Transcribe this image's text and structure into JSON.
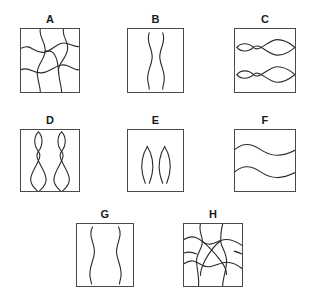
{
  "figure": {
    "background_color": "#ffffff",
    "stroke_color": "#2b2b2b",
    "box_border_color": "#4a4a4a",
    "label_color": "#1a1a1a",
    "width": 314,
    "height": 299
  },
  "panels": [
    {
      "label": "A",
      "id": "panel-a",
      "description": "curved mesh grid of wavy lines",
      "pattern": "mesh",
      "box": {
        "x": 20,
        "y": 28,
        "w": 60,
        "h": 65
      },
      "label_pos": {
        "x": 20,
        "y": 13,
        "w": 60
      }
    },
    {
      "label": "B",
      "id": "panel-b",
      "description": "two vertical wavy lines close together",
      "pattern": "vertical-waves",
      "box": {
        "x": 127,
        "y": 28,
        "w": 57,
        "h": 65
      },
      "label_pos": {
        "x": 127,
        "y": 13,
        "w": 57
      }
    },
    {
      "label": "C",
      "id": "panel-c",
      "description": "two rows of horizontal crossing sinusoids forming lens shapes",
      "pattern": "horizontal-lenses",
      "box": {
        "x": 234,
        "y": 28,
        "w": 62,
        "h": 65
      },
      "label_pos": {
        "x": 234,
        "y": 13,
        "w": 62
      }
    },
    {
      "label": "D",
      "id": "panel-d",
      "description": "two columns of vertical crossing sinusoids forming stacked lens shapes",
      "pattern": "vertical-lenses",
      "box": {
        "x": 20,
        "y": 129,
        "w": 60,
        "h": 63
      },
      "label_pos": {
        "x": 20,
        "y": 114,
        "w": 60
      }
    },
    {
      "label": "E",
      "id": "panel-e",
      "description": "two small pointed leaf shapes",
      "pattern": "leaves",
      "box": {
        "x": 127,
        "y": 129,
        "w": 57,
        "h": 63
      },
      "label_pos": {
        "x": 127,
        "y": 114,
        "w": 57
      }
    },
    {
      "label": "F",
      "id": "panel-f",
      "description": "two horizontal wavy lines",
      "pattern": "horizontal-waves",
      "box": {
        "x": 234,
        "y": 129,
        "w": 62,
        "h": 63
      },
      "label_pos": {
        "x": 234,
        "y": 114,
        "w": 62
      }
    },
    {
      "label": "G",
      "id": "panel-g",
      "description": "two vertical wavy lines spaced wide apart",
      "pattern": "vertical-waves-wide",
      "box": {
        "x": 76,
        "y": 223,
        "w": 58,
        "h": 64
      },
      "label_pos": {
        "x": 76,
        "y": 208,
        "w": 58
      }
    },
    {
      "label": "H",
      "id": "panel-h",
      "description": "dense curved mesh with central diagonal lens",
      "pattern": "mesh-dense",
      "box": {
        "x": 183,
        "y": 223,
        "w": 60,
        "h": 64
      },
      "label_pos": {
        "x": 183,
        "y": 208,
        "w": 60
      }
    }
  ]
}
